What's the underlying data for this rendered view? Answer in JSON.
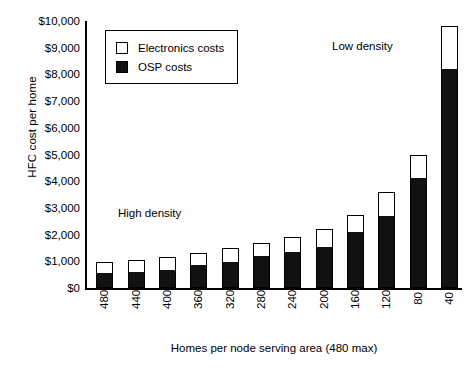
{
  "chart_data": {
    "type": "bar",
    "title": "",
    "subtitle": "",
    "xlabel": "Homes per node serving area (480 max)",
    "ylabel": "HFC cost per home",
    "stacked": true,
    "grid": false,
    "legend_position": "upper-left-inside",
    "categories": [
      "480",
      "440",
      "400",
      "360",
      "320",
      "280",
      "240",
      "200",
      "160",
      "120",
      "80",
      "40"
    ],
    "ylim": [
      0,
      10000
    ],
    "ytick_values": [
      0,
      1000,
      2000,
      3000,
      4000,
      5000,
      6000,
      7000,
      8000,
      9000,
      10000
    ],
    "ytick_labels": [
      "$0",
      "$1,000",
      "$2,000",
      "$3,000",
      "$4,000",
      "$5,000",
      "$6,000",
      "$7,000",
      "$8,000",
      "$9,000",
      "$10,000"
    ],
    "series": [
      {
        "name": "OSP costs",
        "color": "#111111",
        "values": [
          560,
          600,
          680,
          880,
          1000,
          1200,
          1350,
          1550,
          2100,
          2700,
          4150,
          8200
        ]
      },
      {
        "name": "Electronics costs",
        "color": "#ffffff",
        "values": [
          420,
          450,
          470,
          420,
          500,
          500,
          550,
          650,
          650,
          900,
          850,
          1600
        ]
      }
    ],
    "totals": [
      980,
      1050,
      1150,
      1300,
      1500,
      1700,
      1900,
      2200,
      2750,
      3600,
      5000,
      9800
    ],
    "annotations": [
      {
        "text": "High density",
        "x_category": "400",
        "y_value": 3100
      },
      {
        "text": "Low density",
        "x_category": "120",
        "y_value": 9400
      }
    ]
  },
  "legend": {
    "items": [
      {
        "label": "Electronics costs",
        "swatch": "empty-square-icon"
      },
      {
        "label": "OSP costs",
        "swatch": "filled-square-icon"
      }
    ]
  },
  "axes": {
    "y_title": "HFC cost per home",
    "x_title": "Homes per node serving area (480 max)"
  }
}
